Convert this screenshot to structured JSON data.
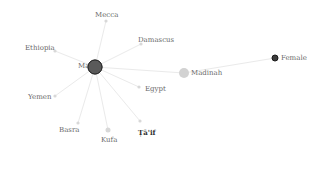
{
  "graph": {
    "center": {
      "id": "Ma",
      "label": "Ma",
      "x": 95,
      "y": 67,
      "r": 7,
      "fill": "#5a5a5a",
      "stroke": "#2a2a2a"
    },
    "nodes": [
      {
        "id": "mecca",
        "label": "Mecca",
        "x": 106,
        "y": 21,
        "r": 1.6,
        "lx": 95,
        "ly": 11,
        "fill": "#d8d8d8"
      },
      {
        "id": "damascus",
        "label": "Damascus",
        "x": 141,
        "y": 44,
        "r": 1.6,
        "lx": 138,
        "ly": 36,
        "fill": "#d8d8d8"
      },
      {
        "id": "ethiopia",
        "label": "Ethiopia",
        "x": 55,
        "y": 51,
        "r": 1.6,
        "lx": 25,
        "ly": 44,
        "fill": "#d8d8d8"
      },
      {
        "id": "egypt",
        "label": "Egypt",
        "x": 139,
        "y": 87,
        "r": 1.6,
        "lx": 145,
        "ly": 85,
        "fill": "#d8d8d8"
      },
      {
        "id": "yemen",
        "label": "Yemen",
        "x": 55,
        "y": 96,
        "r": 1.6,
        "lx": 28,
        "ly": 93,
        "fill": "#d8d8d8"
      },
      {
        "id": "basra",
        "label": "Basra",
        "x": 78,
        "y": 123,
        "r": 1.6,
        "lx": 59,
        "ly": 126,
        "fill": "#d8d8d8"
      },
      {
        "id": "kufa",
        "label": "Kufa",
        "x": 108,
        "y": 130,
        "r": 2.5,
        "lx": 101,
        "ly": 136,
        "fill": "#d8d8d8"
      },
      {
        "id": "taif",
        "label": "Ṭā'if",
        "x": 140,
        "y": 121,
        "r": 1.6,
        "lx": 138,
        "ly": 128,
        "fill": "#d8d8d8",
        "dark": true
      },
      {
        "id": "madinah",
        "label": "Madinah",
        "x": 184,
        "y": 73,
        "r": 5,
        "lx": 191,
        "ly": 69,
        "fill": "#d2d2d2"
      },
      {
        "id": "female",
        "label": "Female",
        "x": 275,
        "y": 58,
        "r": 3,
        "lx": 281,
        "ly": 54,
        "fill": "#3c3c3c",
        "stroke": "#1a1a1a"
      }
    ],
    "edges": [
      [
        "Ma",
        "mecca"
      ],
      [
        "Ma",
        "damascus"
      ],
      [
        "Ma",
        "ethiopia"
      ],
      [
        "Ma",
        "egypt"
      ],
      [
        "Ma",
        "yemen"
      ],
      [
        "Ma",
        "basra"
      ],
      [
        "Ma",
        "kufa"
      ],
      [
        "Ma",
        "taif"
      ],
      [
        "Ma",
        "madinah"
      ],
      [
        "madinah",
        "female"
      ]
    ],
    "edge_color": "#eaeaea"
  }
}
